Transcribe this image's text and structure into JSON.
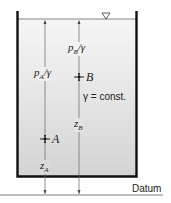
{
  "diagram": {
    "type": "hydrostatic-tank",
    "labels": {
      "pb_over_gamma": "pB/γ",
      "pa_over_gamma": "pA/γ",
      "point_b": "B",
      "point_a": "A",
      "z_b": "zB",
      "z_a": "zA",
      "gamma_const": "γ = const.",
      "datum": "Datum"
    },
    "parts": {
      "pb_main": "p",
      "pb_sub": "B",
      "pb_rest": "/γ",
      "pa_main": "p",
      "pa_sub": "A",
      "pa_rest": "/γ",
      "zb_main": "z",
      "zb_sub": "B",
      "za_main": "z",
      "za_sub": "A"
    },
    "colors": {
      "fluid_top": "#f4f4f4",
      "fluid_bottom": "#d6d6d6",
      "wall": "#111111",
      "line": "#555555"
    }
  }
}
